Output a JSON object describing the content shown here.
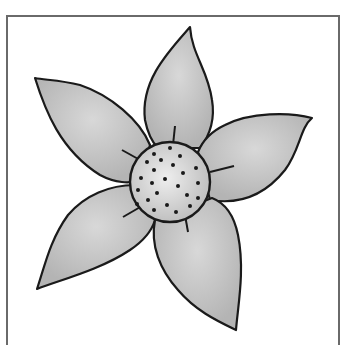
{
  "artwork": {
    "subject": "five-petal flower line drawing",
    "alt": "Gray watercolor flower with five pointed petals and a dotted center",
    "colors": {
      "background": "#ffffff",
      "frame": "#6a6a6a",
      "petal_fill": "#bdbdbd",
      "petal_highlight": "#d8d8d8",
      "outline": "#1a1a1a",
      "center_fill": "#d4d4d4",
      "dots": "#1a1a1a"
    },
    "petal_count": 5,
    "center_dot_count": 24
  }
}
